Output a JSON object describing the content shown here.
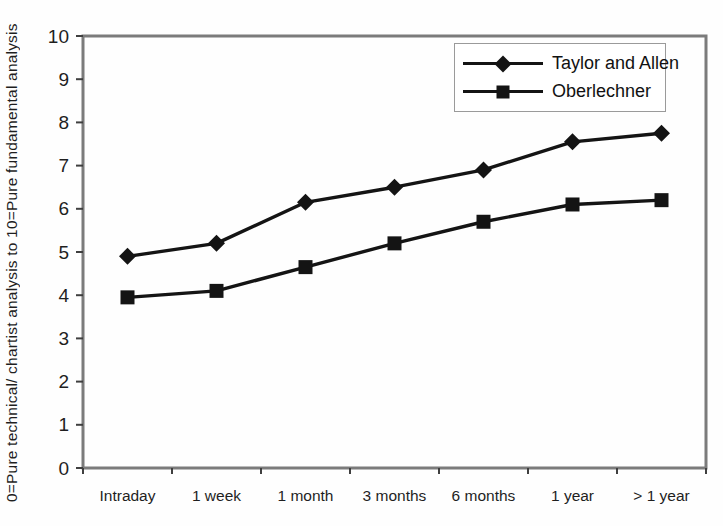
{
  "chart_data": {
    "type": "line",
    "title": "",
    "xlabel": "",
    "ylabel": "0=Pure technical/ chartist analysis to 10=Pure fundamental analysis",
    "categories": [
      "Intraday",
      "1 week",
      "1 month",
      "3 months",
      "6 months",
      "1 year",
      "> 1 year"
    ],
    "series": [
      {
        "name": "Taylor and Allen",
        "marker": "diamond",
        "color": "#141414",
        "values": [
          4.9,
          5.2,
          6.15,
          6.5,
          6.9,
          7.55,
          7.75
        ]
      },
      {
        "name": "Oberlechner",
        "marker": "square",
        "color": "#141414",
        "values": [
          3.95,
          4.1,
          4.65,
          5.2,
          5.7,
          6.1,
          6.2
        ]
      }
    ],
    "ylim": [
      0,
      10
    ],
    "yticks": [
      0,
      1,
      2,
      3,
      4,
      5,
      6,
      7,
      8,
      9,
      10
    ],
    "grid": false,
    "legend_position": "top-right",
    "frame_color": "#7b7b7b",
    "tick_color": "#3f3f3f",
    "text_color": "#1f1f1f",
    "line_width": 3.4
  }
}
